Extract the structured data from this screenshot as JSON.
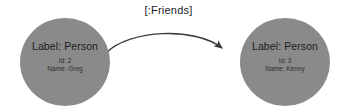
{
  "canvas": {
    "background_color": "#ffffff",
    "width": 337,
    "height": 111
  },
  "graph": {
    "edge": {
      "label": "[:Friends]",
      "direction": "left-to-right",
      "color": "#3a3a3a",
      "arrowhead": "arrow-head-icon"
    },
    "nodes": [
      {
        "id": "node-left",
        "label": "Label: Person",
        "fill_color": "#8a8a8a",
        "properties": [
          {
            "key_value": "Id: 2"
          },
          {
            "key_value": "Name: Greg"
          }
        ]
      },
      {
        "id": "node-right",
        "label": "Label: Person",
        "fill_color": "#8a8a8a",
        "properties": [
          {
            "key_value": "Id: 3"
          },
          {
            "key_value": "Name: Kenny"
          }
        ]
      }
    ]
  }
}
